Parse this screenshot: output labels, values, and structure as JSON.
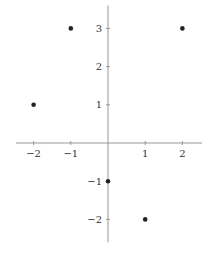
{
  "chart_data": {
    "type": "scatter",
    "title": "",
    "xlabel": "",
    "ylabel": "",
    "xlim": [
      -2.5,
      2.5
    ],
    "ylim": [
      -2.6,
      3.6
    ],
    "grid": false,
    "legend": null,
    "x_ticks": [
      -2,
      -1,
      1,
      2
    ],
    "y_ticks": [
      3,
      2,
      1,
      -1,
      -2
    ],
    "x_tick_labels": [
      "−2",
      "−1",
      "1",
      "2"
    ],
    "y_tick_labels": [
      "3",
      "2",
      "1",
      "−1",
      "−2"
    ],
    "series": [
      {
        "name": "points",
        "color": "#222222",
        "points": [
          {
            "x": -2,
            "y": 1
          },
          {
            "x": -1,
            "y": 3
          },
          {
            "x": 2,
            "y": 3
          },
          {
            "x": 0,
            "y": -1
          },
          {
            "x": 1,
            "y": -2
          }
        ]
      }
    ],
    "axis_color": "#999999"
  }
}
